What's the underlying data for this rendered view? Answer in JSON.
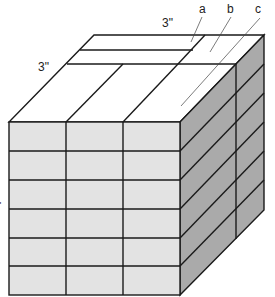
{
  "diagram": {
    "type": "isometric-box-of-bricks",
    "labels": {
      "top_dim": "3\"",
      "left_dim": "3\"",
      "side_dim": "\"",
      "a": "a",
      "b": "b",
      "c": "c"
    },
    "front_face": {
      "rows": 6,
      "columns": 3
    },
    "side_face": {
      "rows": 6,
      "columns": 2
    },
    "top_face": {
      "strips": 2,
      "columns": 3
    },
    "colors": {
      "front": "#e3e3e3",
      "side": "#aaaaaa",
      "top": "#ffffff",
      "line": "#1a1a1a"
    }
  }
}
